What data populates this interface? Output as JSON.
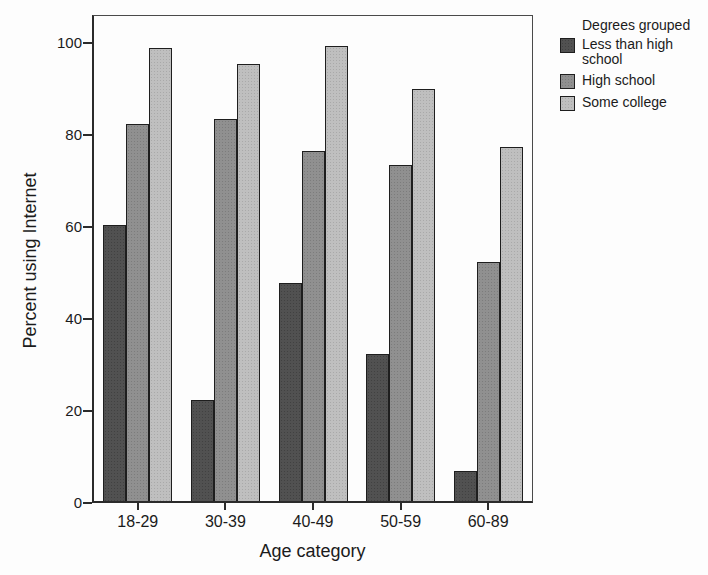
{
  "figure": {
    "y_axis": {
      "label": "Percent using Internet",
      "ticks": [
        0,
        20,
        40,
        60,
        80,
        100
      ]
    },
    "x_axis": {
      "label": "Age category"
    },
    "legend": {
      "title": "Degrees grouped"
    }
  },
  "chart_data": {
    "type": "bar",
    "title": "",
    "categories": [
      "18-29",
      "30-39",
      "40-49",
      "50-59",
      "60-89"
    ],
    "series": [
      {
        "name": "Less than high school",
        "color": "#484848",
        "values": [
          60,
          22,
          47.5,
          32,
          6.5
        ]
      },
      {
        "name": "High school",
        "color": "#8a8a8a",
        "values": [
          82,
          83,
          76,
          73,
          52
        ]
      },
      {
        "name": "Some college",
        "color": "#bcbcbc",
        "values": [
          98.5,
          95,
          99,
          89.5,
          77
        ]
      }
    ],
    "xlabel": "Age category",
    "ylabel": "Percent using Internet",
    "ylim": [
      0,
      100
    ],
    "grid": false,
    "legend_title": "Degrees grouped",
    "legend_position": "top-right"
  }
}
